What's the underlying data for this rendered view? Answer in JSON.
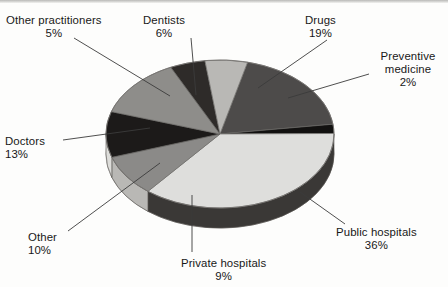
{
  "figure": {
    "kind": "3d-pie-chart",
    "background_color": "#fdfdfc",
    "text_color": "#181818"
  },
  "chart_data": {
    "type": "pie",
    "title": "",
    "subtitle": "",
    "xlabel": "",
    "ylabel": "",
    "three_d": true,
    "grid": false,
    "legend_position": "none",
    "labels_position": "outside-with-leader-lines",
    "total": 100,
    "units": "percent",
    "categories": [
      "Drugs",
      "Preventive medicine",
      "Public hospitals",
      "Private hospitals",
      "Other",
      "Doctors",
      "Other practitioners",
      "Dentists"
    ],
    "values": [
      19,
      2,
      36,
      9,
      10,
      13,
      5,
      6
    ],
    "slices": [
      {
        "label": "Drugs",
        "value": 19,
        "value_text": "19%",
        "color": "#4d4b4a",
        "side_color": "#2f2e2d"
      },
      {
        "label": "Preventive medicine",
        "value": 2,
        "value_text": "2%",
        "color": "#121110",
        "side_color": "#0a0a09"
      },
      {
        "label": "Public hospitals",
        "value": 36,
        "value_text": "36%",
        "color": "#dededc",
        "side_color": "#3a3836"
      },
      {
        "label": "Private hospitals",
        "value": 9,
        "value_text": "9%",
        "color": "#8b8a88",
        "side_color": "#b9b8b5"
      },
      {
        "label": "Other",
        "value": 10,
        "value_text": "10%",
        "color": "#1c1a19",
        "side_color": "#ddddda"
      },
      {
        "label": "Doctors",
        "value": 13,
        "value_text": "13%",
        "color": "#8e8d8a",
        "side_color": "#cfcecb"
      },
      {
        "label": "Other practitioners",
        "value": 5,
        "value_text": "5%",
        "color": "#2e2b29",
        "side_color": "#2e2b29"
      },
      {
        "label": "Dentists",
        "value": 6,
        "value_text": "6%",
        "color": "#b9b8b5",
        "side_color": "#b9b8b5"
      }
    ]
  },
  "labels": {
    "other_practitioners": {
      "name": "Other practitioners",
      "pct": "5%"
    },
    "dentists": {
      "name": "Dentists",
      "pct": "6%"
    },
    "drugs": {
      "name": "Drugs",
      "pct": "19%"
    },
    "preventive": {
      "name": "Preventive medicine",
      "pct": "2%"
    },
    "doctors": {
      "name": "Doctors",
      "pct": "13%"
    },
    "other": {
      "name": "Other",
      "pct": "10%"
    },
    "private_hospitals": {
      "name": "Private hospitals",
      "pct": "9%"
    },
    "public_hospitals": {
      "name": "Public hospitals",
      "pct": "36%"
    }
  }
}
